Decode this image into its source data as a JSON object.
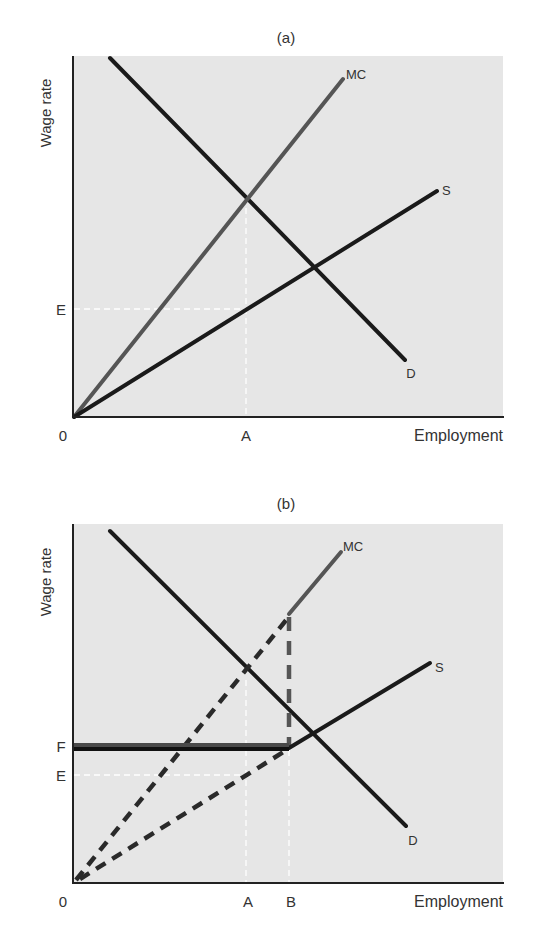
{
  "panels": [
    {
      "id": "a",
      "title": "(a)",
      "y_axis_label": "Wage rate",
      "x_axis_label": "Employment",
      "origin_label": "0",
      "x_ticks": [
        {
          "label": "A"
        }
      ],
      "y_ticks": [
        {
          "label": "E"
        }
      ],
      "curves": [
        {
          "name": "D",
          "label": "D",
          "style": "solid",
          "color": "#1a1a1a"
        },
        {
          "name": "MC",
          "label": "MC",
          "style": "solid",
          "color": "#555555"
        },
        {
          "name": "S",
          "label": "S",
          "style": "solid",
          "color": "#1a1a1a"
        }
      ]
    },
    {
      "id": "b",
      "title": "(b)",
      "y_axis_label": "Wage rate",
      "x_axis_label": "Employment",
      "origin_label": "0",
      "x_ticks": [
        {
          "label": "A"
        },
        {
          "label": "B"
        }
      ],
      "y_ticks": [
        {
          "label": "F"
        },
        {
          "label": "E"
        }
      ],
      "curves": [
        {
          "name": "D",
          "label": "D",
          "style": "solid",
          "color": "#1a1a1a"
        },
        {
          "name": "MC",
          "label": "MC",
          "style": "kinked: dashed below B, vertical dashed gap at B, solid above",
          "color": "#555555"
        },
        {
          "name": "S",
          "label": "S",
          "style": "dashed below B, solid above",
          "color": "#1a1a1a"
        },
        {
          "name": "F-wage-floor",
          "label": "F",
          "style": "thick horizontal to B",
          "color": "#1a1a1a"
        }
      ]
    }
  ],
  "colors": {
    "plot_background": "#e6e6e6",
    "page_background": "#ffffff",
    "axis": "#222222",
    "guide_lines": "#ffffff"
  }
}
